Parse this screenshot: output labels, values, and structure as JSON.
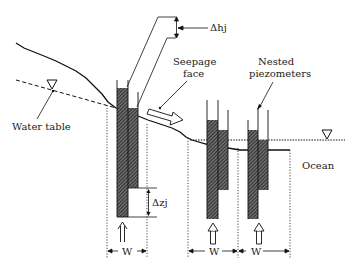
{
  "diagram": {
    "labels": {
      "water_table": "Water table",
      "seepage_face_line1": "Seepage",
      "seepage_face_line2": "face",
      "nested_piezometers_line1": "Nested",
      "nested_piezometers_line2": "piezometers",
      "ocean": "Ocean",
      "delta_hj": "Δhj",
      "delta_zj": "Δzj",
      "width_1": "W",
      "width_2": "W",
      "width_3": "W"
    },
    "symbols": {
      "water_table_marker": "▽",
      "sea_level_marker": "▽"
    },
    "piezometer_sets": [
      {
        "name": "piezometer-set-1",
        "count": 2
      },
      {
        "name": "piezometer-set-2",
        "count": 2
      },
      {
        "name": "piezometer-set-3",
        "count": 2
      }
    ],
    "colors": {
      "line": "#1a1a1a",
      "hatch": "#333333",
      "background": "#ffffff"
    }
  }
}
